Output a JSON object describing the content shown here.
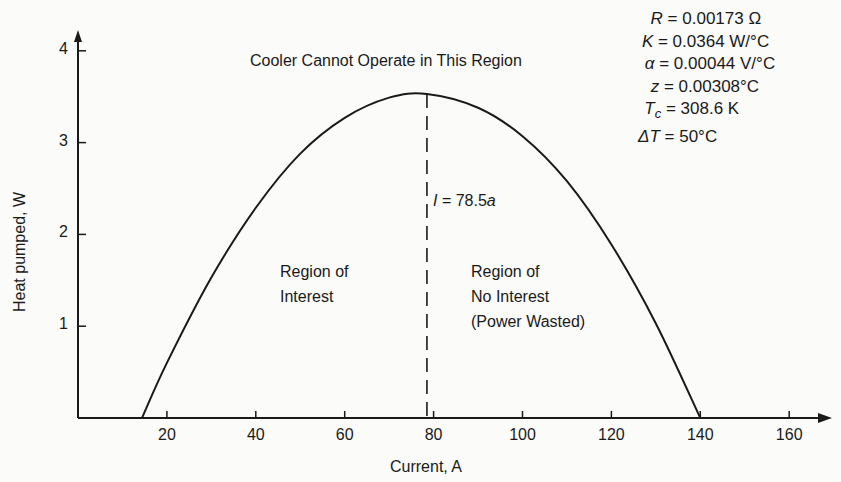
{
  "chart_data": {
    "type": "line",
    "title": "",
    "xlabel": "Current, A",
    "ylabel": "Heat pumped, W",
    "xlim": [
      0,
      168
    ],
    "ylim": [
      0,
      4.3
    ],
    "x_ticks": [
      20,
      40,
      60,
      80,
      100,
      120,
      140,
      160
    ],
    "y_ticks": [
      1,
      2,
      3,
      4
    ],
    "grid": false,
    "legend": null,
    "series": [
      {
        "name": "Heat pumped vs current",
        "x": [
          14.4,
          20,
          30,
          40,
          50,
          60,
          70,
          78.5,
          90,
          100,
          110,
          120,
          130,
          140
        ],
        "y": [
          0,
          0.6,
          1.53,
          2.29,
          2.88,
          3.27,
          3.49,
          3.53,
          3.38,
          3.07,
          2.58,
          1.89,
          1.03,
          0
        ]
      }
    ],
    "vertical_line": {
      "x": 78.5,
      "style": "dashed",
      "label": "I = 78.5a"
    },
    "annotations": [
      {
        "text": "Cooler Cannot Operate in This Region"
      },
      {
        "text": "Region of Interest"
      },
      {
        "text": "Region of No Interest (Power Wasted)"
      }
    ],
    "parameters": [
      "R = 0.00173 Ω",
      "K = 0.0364 W/°C",
      "α = 0.00044 V/°C",
      "z = 0.00308°C",
      "Tc = 308.6 K",
      "ΔT = 50°C"
    ]
  },
  "labels": {
    "xlabel": "Current, A",
    "ylabel": "Heat pumped, W",
    "cannot_operate": "Cooler Cannot Operate in This Region",
    "interest_line1": "Region of",
    "interest_line2": "Interest",
    "no_interest_line1": "Region of",
    "no_interest_line2": "No Interest",
    "no_interest_line3": "(Power Wasted)",
    "peak_current_var": "I",
    "peak_current_eq": " = 78.5",
    "peak_current_unit": "a"
  },
  "x_tick_labels": [
    "20",
    "40",
    "60",
    "80",
    "100",
    "120",
    "140",
    "160"
  ],
  "y_tick_labels": [
    "1",
    "2",
    "3",
    "4"
  ],
  "params": {
    "r": {
      "sym": "R",
      "sub": "",
      "val": " = 0.00173 Ω"
    },
    "k": {
      "sym": "K",
      "sub": "",
      "val": " = 0.0364 W/°C"
    },
    "alpha": {
      "sym": "α",
      "sub": "",
      "val": " = 0.00044 V/°C"
    },
    "z": {
      "sym": "z",
      "sub": "",
      "val": " = 0.00308°C"
    },
    "tc": {
      "sym": "T",
      "sub": "c",
      "val": " = 308.6 K"
    },
    "dt": {
      "sym": "ΔT",
      "sub": "",
      "val": " = 50°C"
    }
  },
  "colors": {
    "ink": "#1a1a1a",
    "paper": "#fbfbf9"
  }
}
